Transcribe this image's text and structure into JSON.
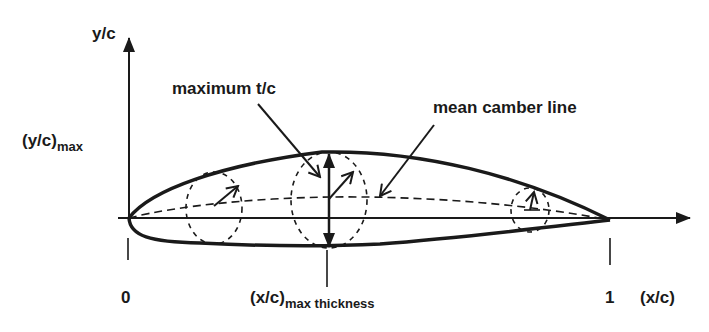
{
  "diagram": {
    "axes": {
      "y_label": "y/c",
      "x_label": "(x/c)"
    },
    "labels": {
      "y_max_main": "(y/c)",
      "y_max_sub": "max",
      "max_tc": "maximum t/c",
      "mean_camber": "mean camber line",
      "tick_zero": "0",
      "tick_one": "1",
      "x_max_main": "(x/c)",
      "x_max_sub": "max thickness"
    },
    "colors": {
      "ink": "#1a1a1a",
      "background": "#ffffff"
    }
  }
}
